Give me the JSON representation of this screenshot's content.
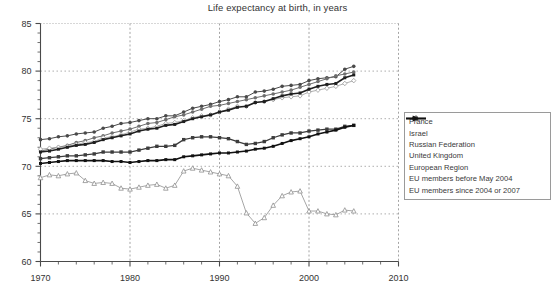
{
  "chart_data": {
    "type": "line",
    "title": "Life expectancy at birth, in years",
    "xlabel": "",
    "ylabel": "",
    "xlim": [
      1970,
      2010
    ],
    "ylim": [
      60,
      85
    ],
    "xticks": [
      1970,
      1980,
      1990,
      2000,
      2010
    ],
    "yticks": [
      60,
      65,
      70,
      75,
      80,
      85
    ],
    "xtick_labels": [
      "1970",
      "1980",
      "1990",
      "2000",
      "2010"
    ],
    "ytick_labels": [
      "60",
      "65",
      "70",
      "75",
      "80",
      "85"
    ],
    "grid": true,
    "grid_style": "dotted",
    "minor_ticks": true,
    "legend_position": "right-middle",
    "x": [
      1970,
      1971,
      1972,
      1973,
      1974,
      1975,
      1976,
      1977,
      1978,
      1979,
      1980,
      1981,
      1982,
      1983,
      1984,
      1985,
      1986,
      1987,
      1988,
      1989,
      1990,
      1991,
      1992,
      1993,
      1994,
      1995,
      1996,
      1997,
      1998,
      1999,
      2000,
      2001,
      2002,
      2003,
      2004,
      2005
    ],
    "series": [
      {
        "name": "France",
        "color": "#4a4a4a",
        "marker": "line-plus",
        "values": [
          72.8,
          72.9,
          73.1,
          73.2,
          73.4,
          73.5,
          73.6,
          74.0,
          74.2,
          74.5,
          74.6,
          74.8,
          75.0,
          75.0,
          75.3,
          75.3,
          75.7,
          76.1,
          76.3,
          76.5,
          76.8,
          77.0,
          77.3,
          77.3,
          77.8,
          77.9,
          78.1,
          78.4,
          78.5,
          78.6,
          79.0,
          79.2,
          79.3,
          79.4,
          80.2,
          80.5
        ]
      },
      {
        "name": "Israel",
        "color": "#6e6e6e",
        "marker": "line-arrow",
        "values": [
          71.6,
          71.8,
          72.0,
          72.2,
          72.5,
          72.7,
          73.0,
          73.2,
          73.5,
          73.7,
          73.9,
          74.2,
          74.5,
          74.6,
          74.9,
          75.2,
          75.4,
          75.7,
          76.0,
          76.3,
          76.4,
          76.6,
          76.8,
          77.0,
          77.2,
          77.4,
          77.6,
          77.8,
          78.0,
          78.3,
          78.6,
          78.9,
          79.2,
          79.5,
          79.7,
          79.9
        ]
      },
      {
        "name": "Russian Federation",
        "color": "#8f8f8f",
        "marker": "triangle",
        "values": [
          68.8,
          69.1,
          69.0,
          69.2,
          69.3,
          68.5,
          68.2,
          68.3,
          68.2,
          67.7,
          67.6,
          67.8,
          68.0,
          68.1,
          67.7,
          68.0,
          69.5,
          69.8,
          69.6,
          69.4,
          69.2,
          69.0,
          67.9,
          65.1,
          64.0,
          64.6,
          65.9,
          66.9,
          67.3,
          67.4,
          65.3,
          65.3,
          65.0,
          64.9,
          65.4,
          65.3
        ]
      },
      {
        "name": "United Kingdom",
        "color": "#9a9a9a",
        "marker": "diamond",
        "values": [
          71.8,
          71.9,
          72.0,
          72.1,
          72.3,
          72.5,
          72.6,
          73.0,
          73.1,
          73.3,
          73.6,
          73.9,
          74.0,
          74.2,
          74.5,
          74.6,
          74.8,
          75.1,
          75.3,
          75.4,
          75.7,
          76.0,
          76.3,
          76.3,
          76.7,
          76.8,
          77.0,
          77.2,
          77.3,
          77.4,
          77.8,
          78.0,
          78.2,
          78.4,
          78.7,
          79.0
        ]
      },
      {
        "name": "European Region",
        "color": "#3c3c3c",
        "marker": "line-square",
        "values": [
          70.8,
          70.9,
          71.0,
          71.1,
          71.1,
          71.2,
          71.3,
          71.5,
          71.5,
          71.5,
          71.5,
          71.7,
          71.9,
          72.1,
          72.1,
          72.2,
          72.8,
          73.0,
          73.1,
          73.1,
          73.0,
          72.9,
          72.6,
          72.3,
          72.4,
          72.6,
          73.0,
          73.3,
          73.5,
          73.5,
          73.7,
          73.8,
          73.9,
          73.9,
          74.2,
          74.3
        ]
      },
      {
        "name": "EU members before May 2004",
        "color": "#1f1f1f",
        "marker": "line-bold",
        "values": [
          71.5,
          71.6,
          71.8,
          72.0,
          72.2,
          72.3,
          72.5,
          72.8,
          73.0,
          73.2,
          73.4,
          73.7,
          73.9,
          74.0,
          74.3,
          74.4,
          74.7,
          75.0,
          75.2,
          75.4,
          75.7,
          75.9,
          76.2,
          76.3,
          76.7,
          76.8,
          77.1,
          77.4,
          77.6,
          77.7,
          78.1,
          78.4,
          78.6,
          78.7,
          79.3,
          79.6
        ]
      },
      {
        "name": "EU members since 2004 or 2007",
        "color": "#111111",
        "marker": "line-bold-arrow",
        "values": [
          70.3,
          70.4,
          70.5,
          70.6,
          70.6,
          70.6,
          70.6,
          70.6,
          70.5,
          70.5,
          70.4,
          70.5,
          70.6,
          70.6,
          70.7,
          70.7,
          71.0,
          71.1,
          71.2,
          71.3,
          71.4,
          71.4,
          71.5,
          71.6,
          71.8,
          71.9,
          72.1,
          72.4,
          72.7,
          72.9,
          73.1,
          73.4,
          73.6,
          73.8,
          74.1,
          74.3
        ]
      }
    ]
  },
  "legend": {
    "items": [
      {
        "label": "France"
      },
      {
        "label": "Israel"
      },
      {
        "label": "Russian Federation"
      },
      {
        "label": "United Kingdom"
      },
      {
        "label": "European Region"
      },
      {
        "label": "EU members before May 2004"
      },
      {
        "label": "EU members since 2004 or 2007"
      }
    ]
  }
}
